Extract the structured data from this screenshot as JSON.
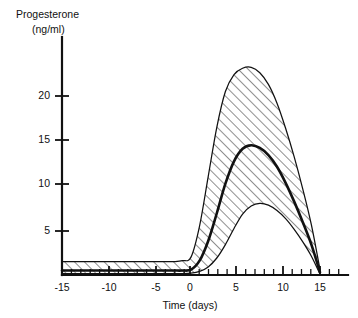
{
  "figure": {
    "y_axis_title_line1": "Progesterone",
    "y_axis_title_line2": "(ng/ml)",
    "x_axis_title": "Time (days)"
  },
  "axes": {
    "y_ticks": [
      "5",
      "10",
      "15",
      "20"
    ],
    "x_ticks": [
      "-15",
      "-10",
      "-5",
      "0",
      "5",
      "10",
      "15"
    ]
  },
  "colors": {
    "ink": "#111111",
    "background": "#ffffff",
    "hatch": "#333333"
  },
  "chart_data": {
    "type": "line",
    "title": "Progesterone (ng/ml)",
    "subtitle": "",
    "xlabel": "Time (days)",
    "ylabel": "Progesterone (ng/ml)",
    "xlim": [
      -15,
      15
    ],
    "ylim": [
      0,
      25
    ],
    "grid": false,
    "legend_position": "none",
    "x_tick_values": [
      -15,
      -10,
      -5,
      0,
      5,
      10,
      15
    ],
    "x_minor_tick_interval": 1,
    "y_tick_values": [
      5,
      10,
      15,
      20
    ],
    "annotations": [
      "Shaded band shows range (upper and lower bounds); heavy central line is the mean."
    ],
    "x": [
      -15,
      -14,
      -13,
      -12,
      -11,
      -10,
      -9,
      -8,
      -7,
      -6,
      -5,
      -4,
      -3,
      -2,
      -1,
      0,
      1,
      2,
      3,
      4,
      5,
      6,
      7,
      8,
      9,
      10,
      11,
      12,
      13,
      14,
      15
    ],
    "series": [
      {
        "name": "Upper bound",
        "values": [
          1.5,
          1.5,
          1.5,
          1.5,
          1.5,
          1.5,
          1.5,
          1.5,
          1.5,
          1.5,
          1.5,
          1.5,
          1.5,
          1.5,
          1.6,
          2.0,
          5.5,
          11.0,
          16.5,
          20.5,
          22.4,
          23.1,
          23.2,
          22.6,
          21.3,
          19.2,
          16.4,
          13.2,
          9.6,
          5.6,
          0.6
        ]
      },
      {
        "name": "Mean",
        "values": [
          0.5,
          0.5,
          0.5,
          0.5,
          0.5,
          0.5,
          0.5,
          0.5,
          0.5,
          0.5,
          0.5,
          0.5,
          0.5,
          0.5,
          0.5,
          0.6,
          1.6,
          3.8,
          6.9,
          10.2,
          12.7,
          14.1,
          14.5,
          14.2,
          13.4,
          12.1,
          10.3,
          8.2,
          5.9,
          3.4,
          0.3
        ]
      },
      {
        "name": "Lower bound",
        "values": [
          0.15,
          0.15,
          0.15,
          0.15,
          0.15,
          0.15,
          0.15,
          0.15,
          0.15,
          0.15,
          0.15,
          0.15,
          0.15,
          0.15,
          0.15,
          0.2,
          0.4,
          0.9,
          1.9,
          3.4,
          5.2,
          6.8,
          7.7,
          8.0,
          7.8,
          7.2,
          6.3,
          5.1,
          3.7,
          2.1,
          0.1
        ]
      }
    ]
  }
}
